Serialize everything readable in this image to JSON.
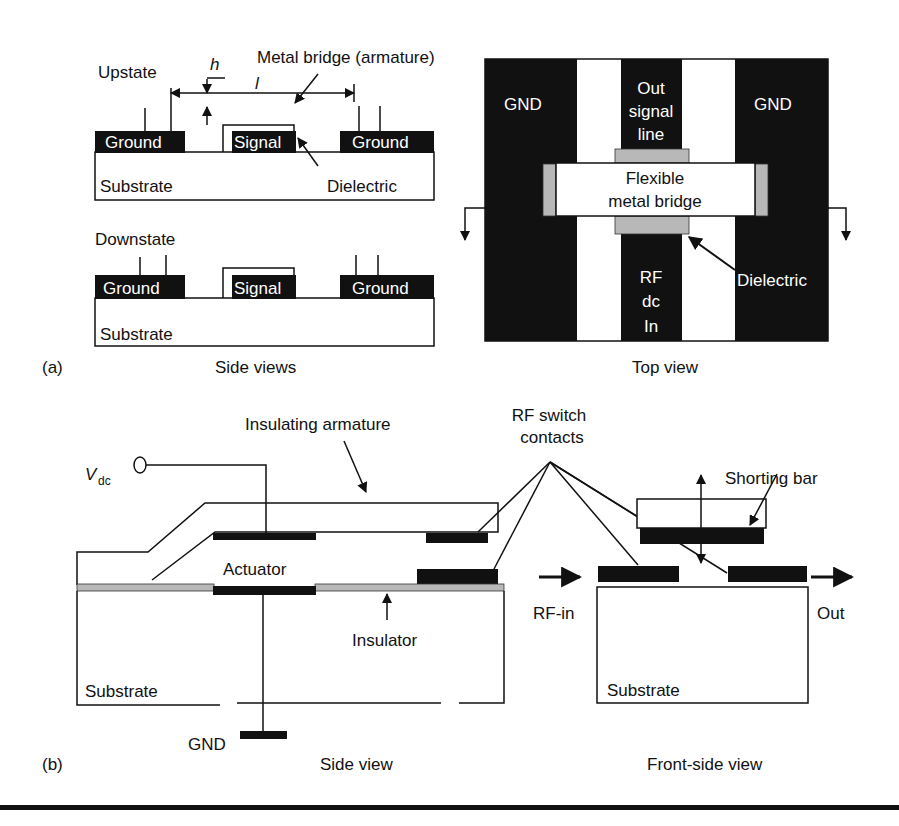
{
  "panel_a": {
    "tag": "(a)",
    "side_views": {
      "caption": "Side views",
      "upstate": {
        "label": "Upstate",
        "ground_left": "Ground",
        "signal": "Signal",
        "ground_right": "Ground",
        "substrate": "Substrate",
        "dielectric": "Dielectric",
        "bridge_label": "Metal bridge (armature)",
        "gap_symbol": "h",
        "length_symbol": "l"
      },
      "downstate": {
        "label": "Downstate",
        "ground_left": "Ground",
        "signal": "Signal",
        "ground_right": "Ground",
        "substrate": "Substrate"
      }
    },
    "top_view": {
      "caption": "Top view",
      "gnd_left": "GND",
      "gnd_right": "GND",
      "out_line": [
        "Out",
        "signal",
        "line"
      ],
      "bridge": [
        "Flexible",
        "metal bridge"
      ],
      "in_line": [
        "RF",
        "dc",
        "In"
      ],
      "dielectric": "Dielectric"
    }
  },
  "panel_b": {
    "tag": "(b)",
    "side_view": {
      "caption": "Side view",
      "vdc_main": "V",
      "vdc_sub": "dc",
      "insulating_armature": "Insulating armature",
      "rf_contacts": [
        "RF switch",
        "contacts"
      ],
      "actuator": "Actuator",
      "insulator": "Insulator",
      "substrate": "Substrate",
      "gnd": "GND"
    },
    "front_view": {
      "caption": "Front-side view",
      "shorting_bar": "Shorting bar",
      "rf_in": "RF-in",
      "out": "Out",
      "substrate": "Substrate"
    }
  },
  "colors": {
    "ink": "#111111",
    "insulator_gray": "#b8b8b8",
    "background": "#ffffff"
  }
}
